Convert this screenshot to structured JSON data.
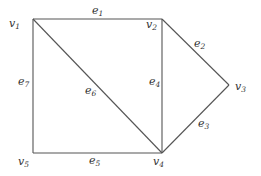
{
  "graph": {
    "vertices": [
      {
        "id": "v1",
        "name": "v",
        "sub": "1",
        "x": 33,
        "y": 19,
        "lx": 9,
        "ly": 27
      },
      {
        "id": "v2",
        "name": "v",
        "sub": "2",
        "x": 162,
        "y": 19,
        "lx": 146,
        "ly": 28
      },
      {
        "id": "v3",
        "name": "v",
        "sub": "3",
        "x": 229,
        "y": 85,
        "lx": 235,
        "ly": 90
      },
      {
        "id": "v4",
        "name": "v",
        "sub": "4",
        "x": 162,
        "y": 153,
        "lx": 153,
        "ly": 165
      },
      {
        "id": "v5",
        "name": "v",
        "sub": "5",
        "x": 33,
        "y": 153,
        "lx": 18,
        "ly": 165
      }
    ],
    "edges": [
      {
        "id": "e1",
        "name": "e",
        "sub": "1",
        "from": "v1",
        "to": "v2",
        "lx": 92,
        "ly": 14
      },
      {
        "id": "e2",
        "name": "e",
        "sub": "2",
        "from": "v2",
        "to": "v3",
        "lx": 194,
        "ly": 47
      },
      {
        "id": "e3",
        "name": "e",
        "sub": "3",
        "from": "v3",
        "to": "v4",
        "lx": 198,
        "ly": 127
      },
      {
        "id": "e4",
        "name": "e",
        "sub": "4",
        "from": "v2",
        "to": "v4",
        "lx": 149,
        "ly": 85
      },
      {
        "id": "e5",
        "name": "e",
        "sub": "5",
        "from": "v5",
        "to": "v4",
        "lx": 89,
        "ly": 164
      },
      {
        "id": "e6",
        "name": "e",
        "sub": "6",
        "from": "v1",
        "to": "v4",
        "lx": 85,
        "ly": 94
      },
      {
        "id": "e7",
        "name": "e",
        "sub": "7",
        "from": "v1",
        "to": "v5",
        "lx": 18,
        "ly": 85
      }
    ]
  }
}
